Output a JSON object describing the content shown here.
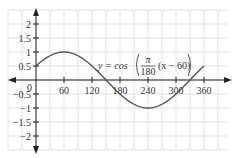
{
  "chart_data": {
    "type": "line",
    "title": "",
    "equation": {
      "lhs": "y = cos",
      "frac_num": "π",
      "frac_den": "180",
      "rest": "(x − 60)"
    },
    "xlabel": "",
    "ylabel": "",
    "xlim": [
      0,
      360
    ],
    "ylim": [
      -2,
      2
    ],
    "grid": true,
    "x_ticks": [
      "60",
      "120",
      "180",
      "240",
      "300",
      "360"
    ],
    "y_ticks": [
      "2",
      "1.5",
      "1",
      "0.5",
      "−0.5",
      "−1",
      "−1.5",
      "−2"
    ],
    "origin_label": "0",
    "series": [
      {
        "name": "y = cos(π/180 (x − 60))",
        "x": [
          0,
          30,
          60,
          90,
          120,
          150,
          180,
          210,
          240,
          270,
          300,
          330,
          360
        ],
        "values": [
          0.5,
          0.866,
          1,
          0.866,
          0.5,
          0,
          -0.5,
          -0.866,
          -1,
          -0.866,
          -0.5,
          0,
          0.5
        ]
      }
    ],
    "colors": {
      "curve": "#555555",
      "axis": "#222222",
      "grid": "#d8d8d8"
    }
  }
}
